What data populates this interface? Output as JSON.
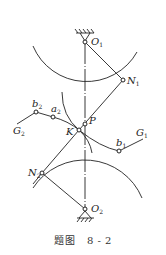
{
  "figure": {
    "caption_prefix": "题图",
    "caption_number": "8 - 2",
    "line_color": "#222222",
    "points": {
      "O1": {
        "label": "O",
        "sub": "1"
      },
      "O2": {
        "label": "O",
        "sub": "2"
      },
      "N1": {
        "label": "N",
        "sub": "1"
      },
      "N2": {
        "label": "N",
        "sub": "2"
      },
      "P": {
        "label": "P",
        "sub": ""
      },
      "K": {
        "label": "K",
        "sub": ""
      },
      "a2": {
        "label": "a",
        "sub": "2"
      },
      "b2": {
        "label": "b",
        "sub": "2"
      },
      "b1": {
        "label": "b",
        "sub": "1"
      },
      "G1": {
        "label": "G",
        "sub": "1"
      },
      "G2": {
        "label": "G",
        "sub": "2"
      }
    }
  }
}
